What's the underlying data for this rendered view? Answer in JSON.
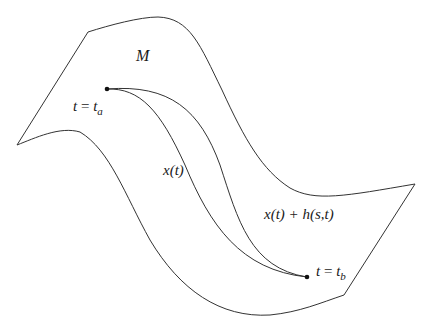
{
  "diagram": {
    "manifold_label": "M",
    "start_label": {
      "lhs": "t",
      "eq": " = ",
      "var": "t",
      "sub": "a"
    },
    "end_label": {
      "lhs": "t",
      "eq": " = ",
      "var": "t",
      "sub": "b"
    },
    "curve_label": "x(t)",
    "perturbed_curve_label": "x(t) + h(s,t)",
    "colors": {
      "stroke": "#333333",
      "text": "#1a1a1a",
      "background": "#ffffff"
    },
    "points": {
      "start": {
        "x": 107,
        "y": 89
      },
      "end": {
        "x": 307,
        "y": 277
      }
    }
  }
}
